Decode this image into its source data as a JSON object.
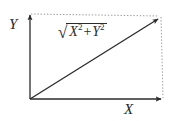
{
  "diagram": {
    "background_color": "#ffffff",
    "line_color": "#2b2b2b",
    "dotted_color": "#9a9a9a",
    "axes": {
      "y_label": "Y",
      "x_label": "X"
    },
    "formula": {
      "radical_sign": "√",
      "term_x": "X",
      "exponent_x": "2",
      "operator": "+",
      "term_y": "Y",
      "exponent_y": "2",
      "full_text": "√(X² + Y²)"
    },
    "geometry": {
      "origin_x": 30,
      "origin_y": 99,
      "x_axis_end_x": 163,
      "y_axis_end_y": 14,
      "resultant_end_x": 160,
      "resultant_end_y": 17
    }
  }
}
